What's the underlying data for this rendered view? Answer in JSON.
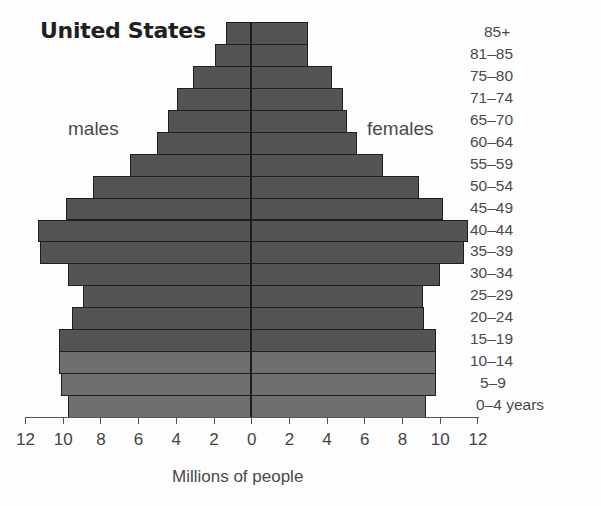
{
  "title": "United States",
  "left_label": "males",
  "right_label": "females",
  "xlabel": "Millions of people",
  "colors": {
    "bar_dark": "#545454",
    "bar_light": "#6f6f6f",
    "outline": "#1e1e1e"
  },
  "axis": {
    "ticks_left": [
      "12",
      "10",
      "8",
      "6",
      "4",
      "2",
      "0"
    ],
    "ticks_right": [
      "2",
      "4",
      "6",
      "8",
      "10",
      "12"
    ]
  },
  "chart_data": {
    "type": "bar",
    "subtype": "population-pyramid",
    "title": "United States",
    "xlabel": "Millions of people",
    "ylabel": "",
    "xlim": [
      -12,
      12
    ],
    "x_tick_values": [
      12,
      10,
      8,
      6,
      4,
      2,
      0,
      2,
      4,
      6,
      8,
      10,
      12
    ],
    "categories": [
      "85+",
      "81–85",
      "75–80",
      "71–74",
      "65–70",
      "60–64",
      "55–59",
      "50–54",
      "45–49",
      "40–44",
      "35–39",
      "30–34",
      "25–29",
      "20–24",
      "15–19",
      "10–14",
      "5–9",
      "0–4 years"
    ],
    "series": [
      {
        "name": "males",
        "side": "left",
        "values": [
          1.3,
          1.9,
          3.1,
          3.9,
          4.4,
          5.0,
          6.4,
          8.4,
          9.8,
          11.3,
          11.2,
          9.7,
          8.9,
          9.5,
          10.2,
          10.2,
          10.1,
          9.7
        ]
      },
      {
        "name": "females",
        "side": "right",
        "values": [
          3.0,
          3.0,
          4.3,
          4.9,
          5.1,
          5.6,
          7.0,
          8.9,
          10.2,
          11.5,
          11.3,
          10.0,
          9.1,
          9.2,
          9.8,
          9.8,
          9.8,
          9.3
        ]
      }
    ],
    "shading_note": "Bottom three age groups (10–14, 5–9, 0–4) drawn in lighter gray",
    "grid": false,
    "legend": "inline text labels: males (left), females (right)"
  }
}
